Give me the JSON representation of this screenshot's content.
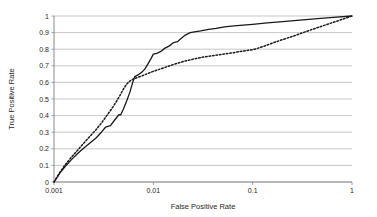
{
  "chart_data": {
    "type": "line",
    "title": "",
    "subtitle": "",
    "xlabel": "False Positive Rate",
    "ylabel": "True Positive Rate",
    "xscale": "log",
    "yscale": "linear",
    "xlim": [
      0.001,
      1
    ],
    "ylim": [
      0,
      1
    ],
    "grid": "horizontal",
    "legend": "none",
    "xticks": [
      0.001,
      0.01,
      0.1,
      1
    ],
    "xticklabels": [
      "0.001",
      "0.01",
      "0.1",
      "1"
    ],
    "yticks": [
      0,
      0.1,
      0.2,
      0.3,
      0.4,
      0.5,
      0.6,
      0.7,
      0.8,
      0.9,
      1
    ],
    "yticklabels": [
      "0",
      "0.1",
      "0.2",
      "0.3",
      "0.4",
      "0.5",
      "0.6",
      "0.7",
      "0.8",
      "0.9",
      "1"
    ],
    "series": [
      {
        "name": "solid-curve",
        "style": "solid",
        "color": "#1a1a1a",
        "width": 1.3,
        "points": [
          [
            0.001,
            0.0
          ],
          [
            0.00115,
            0.055
          ],
          [
            0.0013,
            0.095
          ],
          [
            0.0015,
            0.135
          ],
          [
            0.00175,
            0.175
          ],
          [
            0.002,
            0.205
          ],
          [
            0.0023,
            0.235
          ],
          [
            0.00265,
            0.265
          ],
          [
            0.003,
            0.3
          ],
          [
            0.0033,
            0.33
          ],
          [
            0.0037,
            0.34
          ],
          [
            0.0041,
            0.375
          ],
          [
            0.0045,
            0.405
          ],
          [
            0.0047,
            0.405
          ],
          [
            0.005,
            0.44
          ],
          [
            0.0054,
            0.49
          ],
          [
            0.0058,
            0.54
          ],
          [
            0.0062,
            0.6
          ],
          [
            0.0065,
            0.635
          ],
          [
            0.007,
            0.645
          ],
          [
            0.0076,
            0.66
          ],
          [
            0.0082,
            0.68
          ],
          [
            0.0088,
            0.71
          ],
          [
            0.0095,
            0.745
          ],
          [
            0.01,
            0.77
          ],
          [
            0.0108,
            0.775
          ],
          [
            0.0118,
            0.785
          ],
          [
            0.013,
            0.805
          ],
          [
            0.0145,
            0.82
          ],
          [
            0.016,
            0.84
          ],
          [
            0.0175,
            0.845
          ],
          [
            0.019,
            0.865
          ],
          [
            0.021,
            0.885
          ],
          [
            0.0235,
            0.9
          ],
          [
            0.026,
            0.905
          ],
          [
            0.03,
            0.91
          ],
          [
            0.036,
            0.92
          ],
          [
            0.043,
            0.925
          ],
          [
            0.052,
            0.935
          ],
          [
            0.065,
            0.94
          ],
          [
            0.08,
            0.945
          ],
          [
            0.1,
            0.95
          ],
          [
            0.14,
            0.958
          ],
          [
            0.2,
            0.966
          ],
          [
            0.3,
            0.975
          ],
          [
            0.45,
            0.984
          ],
          [
            0.65,
            0.992
          ],
          [
            1.0,
            1.0
          ]
        ]
      },
      {
        "name": "dotted-curve",
        "style": "dotted",
        "color": "#1a1a1a",
        "width": 1.5,
        "points": [
          [
            0.001,
            0.0
          ],
          [
            0.00115,
            0.06
          ],
          [
            0.0013,
            0.105
          ],
          [
            0.0015,
            0.15
          ],
          [
            0.00175,
            0.195
          ],
          [
            0.002,
            0.235
          ],
          [
            0.0023,
            0.275
          ],
          [
            0.00265,
            0.315
          ],
          [
            0.003,
            0.355
          ],
          [
            0.0034,
            0.4
          ],
          [
            0.0038,
            0.44
          ],
          [
            0.0042,
            0.48
          ],
          [
            0.0046,
            0.52
          ],
          [
            0.005,
            0.56
          ],
          [
            0.0054,
            0.59
          ],
          [
            0.0058,
            0.608
          ],
          [
            0.0062,
            0.618
          ],
          [
            0.0068,
            0.628
          ],
          [
            0.0076,
            0.638
          ],
          [
            0.0085,
            0.65
          ],
          [
            0.0095,
            0.662
          ],
          [
            0.011,
            0.675
          ],
          [
            0.013,
            0.69
          ],
          [
            0.0155,
            0.705
          ],
          [
            0.0185,
            0.72
          ],
          [
            0.022,
            0.732
          ],
          [
            0.027,
            0.744
          ],
          [
            0.033,
            0.754
          ],
          [
            0.041,
            0.762
          ],
          [
            0.05,
            0.77
          ],
          [
            0.062,
            0.778
          ],
          [
            0.075,
            0.786
          ],
          [
            0.09,
            0.793
          ],
          [
            0.105,
            0.8
          ],
          [
            0.13,
            0.818
          ],
          [
            0.16,
            0.838
          ],
          [
            0.2,
            0.858
          ],
          [
            0.26,
            0.88
          ],
          [
            0.34,
            0.905
          ],
          [
            0.45,
            0.93
          ],
          [
            0.6,
            0.955
          ],
          [
            0.8,
            0.98
          ],
          [
            1.0,
            1.0
          ]
        ]
      }
    ]
  },
  "axes": {
    "x_title": "False Positive Rate",
    "y_title": "True Positive Rate",
    "x_labels": [
      "0.001",
      "0.01",
      "0.1",
      "1"
    ],
    "y_labels": [
      "1",
      "0.9",
      "0.8",
      "0.7",
      "0.6",
      "0.5",
      "0.4",
      "0.3",
      "0.2",
      "0.1",
      "0"
    ]
  },
  "colors": {
    "background": "#ffffff",
    "gridline": "#b9b9b9",
    "axis": "#8a8a8a",
    "curve": "#1a1a1a",
    "text": "#2a2626"
  }
}
